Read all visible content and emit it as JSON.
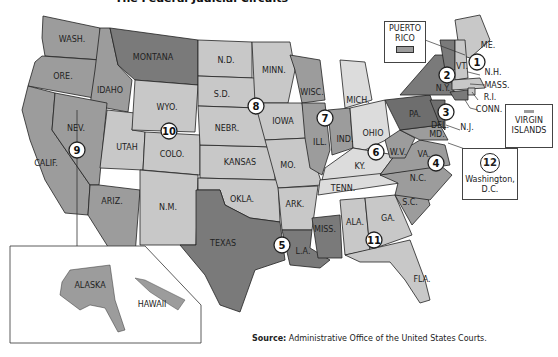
{
  "title": "The Federal Judicial Circuits",
  "colors": {
    "dark": "#7a7a7a",
    "medium": "#9c9c9c",
    "light": "#c8c8c8",
    "lighter": "#dcdcdc",
    "border": "#222222",
    "background": "#ffffff"
  },
  "states": {
    "wash": "WASH.",
    "ore": "ORE.",
    "calif": "CALIF.",
    "idaho": "IDAHO",
    "nev": "NEV.",
    "montana": "MONTANA",
    "ariz": "ARIZ.",
    "utah": "UTAH",
    "wyo": "WYO.",
    "colo": "COLO.",
    "nm": "N.M.",
    "nd": "N.D.",
    "sd": "S.D.",
    "nebr": "NEBR.",
    "kansas": "KANSAS",
    "okla": "OKLA.",
    "texas": "TEXAS",
    "minn": "MINN.",
    "iowa": "IOWA",
    "mo": "MO.",
    "ark": "ARK.",
    "la": "L.A.",
    "wisc": "WISC.",
    "ill": "ILL.",
    "ind": "IND.",
    "mich": "MICH.",
    "ohio": "OHIO",
    "ky": "KY.",
    "tenn": "TENN.",
    "miss": "MISS.",
    "ala": "ALA.",
    "ga": "GA.",
    "fla": "FLA.",
    "sc": "S.C.",
    "nc": "N.C.",
    "va": "VA.",
    "wv": "W.V.",
    "md": "MD.",
    "del": "DEL.",
    "pa": "PA.",
    "nj": "N.J.",
    "ny": "N.Y.",
    "vt": "VT.",
    "me": "ME.",
    "nh": "N.H.",
    "mass": "MASS.",
    "ri": "R.I.",
    "conn": "CONN.",
    "alaska": "ALASKA",
    "hawaii": "HAWAII"
  },
  "circuits": [
    "1",
    "2",
    "3",
    "4",
    "5",
    "6",
    "7",
    "8",
    "9",
    "10",
    "11",
    "12"
  ],
  "callouts": {
    "puerto_rico": "PUERTO RICO",
    "virgin_islands": "VIRGIN ISLANDS",
    "dc_number": "12",
    "dc_label": "Washington, D.C."
  },
  "source": {
    "label": "Source:",
    "text": "Administrative Office of the United States Courts."
  }
}
